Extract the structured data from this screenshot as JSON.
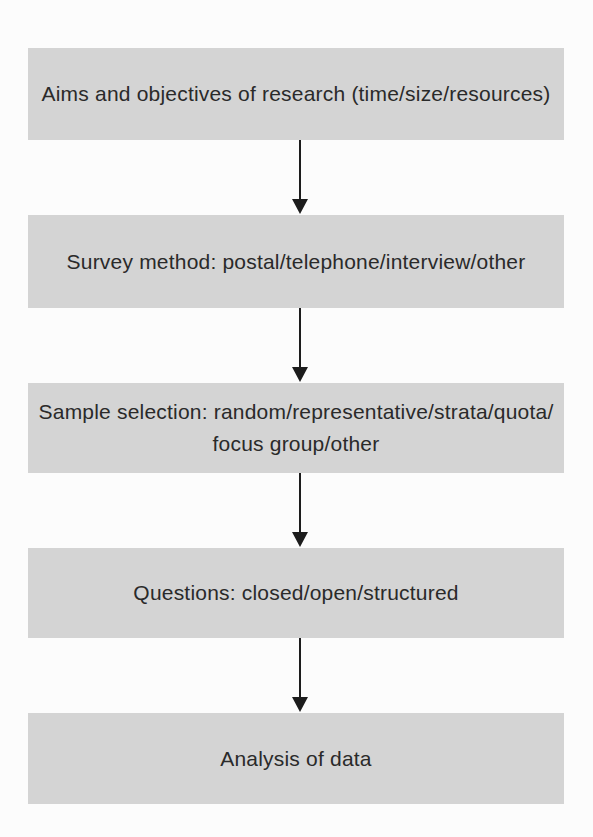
{
  "diagram": {
    "type": "flowchart",
    "direction": "top-down",
    "connector": "down-arrow",
    "colors": {
      "box_fill": "#d4d4d4",
      "text": "#2a2a2a",
      "arrow": "#1c1c1c",
      "page_background": "#fcfcfc"
    },
    "steps": [
      {
        "label": "Aims and objectives of research (time/size/resources)"
      },
      {
        "label": "Survey method: postal/telephone/interview/other"
      },
      {
        "label": "Sample selection: random/representative/strata/quota/\nfocus group/other"
      },
      {
        "label": "Questions: closed/open/structured"
      },
      {
        "label": "Analysis of data"
      }
    ]
  }
}
